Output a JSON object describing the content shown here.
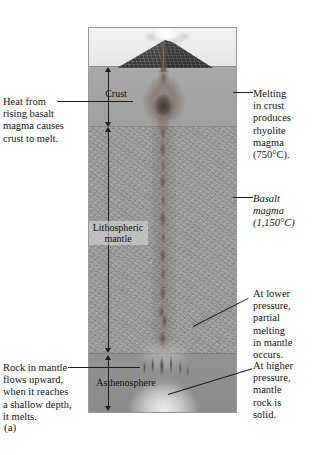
{
  "figure": {
    "caption": "(a)"
  },
  "panel": {
    "layers": [
      {
        "id": "sky",
        "label": "",
        "icon": "sky-region"
      },
      {
        "id": "crust",
        "label": "Crust",
        "icon": "crust-layer"
      },
      {
        "id": "lithospheric",
        "label": "Lithospheric\nmantle",
        "label_line1": "Lithospheric",
        "label_line2": "mantle",
        "icon": "lithospheric-mantle-layer"
      },
      {
        "id": "asthenosphere",
        "label": "Asthenosphere",
        "icon": "asthenosphere-layer"
      }
    ],
    "features": [
      {
        "id": "volcano",
        "name": "volcano-cone-icon"
      },
      {
        "id": "ash-plume",
        "name": "ash-plume-icon"
      },
      {
        "id": "magma-chamber",
        "name": "rhyolite-magma-chamber-icon"
      },
      {
        "id": "basalt-dike",
        "name": "basalt-dike-icon"
      },
      {
        "id": "melt-head",
        "name": "partial-melt-zone-icon"
      },
      {
        "id": "diapirs",
        "name": "mantle-diapir-icon"
      }
    ],
    "depth_scales": [
      {
        "id": "crust-thickness",
        "name": "crust-depth-arrow"
      },
      {
        "id": "lithosphere-thickness",
        "name": "lithospheric-mantle-depth-arrow"
      },
      {
        "id": "asthenosphere-thickness",
        "name": "asthenosphere-depth-arrow"
      }
    ]
  },
  "callouts": {
    "heat": {
      "lines": [
        "Heat from",
        "rising basalt",
        "magma causes",
        "crust to melt."
      ],
      "text": "Heat from rising basalt magma causes crust to melt.",
      "side": "left"
    },
    "rock_in_mantle": {
      "lines": [
        "Rock in mantle",
        "flows upward,",
        "when it reaches",
        "a shallow depth,",
        "it melts."
      ],
      "text": "Rock in mantle flows upward, when it reaches a shallow depth, it melts.",
      "side": "left"
    },
    "melting_in_crust": {
      "lines": [
        "Melting",
        "in crust",
        "produces",
        "rhyolite",
        "magma",
        "(750°C)."
      ],
      "text": "Melting in crust produces rhyolite magma (750°C).",
      "temperature": "750°C",
      "magma_type": "rhyolite",
      "side": "right"
    },
    "basalt_magma": {
      "lines": [
        "Basalt",
        "magma",
        "(1,150°C)"
      ],
      "text": "Basalt magma (1,150°C)",
      "temperature": "1,150°C",
      "magma_type": "basalt",
      "italic": true,
      "side": "right"
    },
    "lower_pressure": {
      "lines": [
        "At lower",
        "pressure,",
        "partial",
        "melting",
        "in mantle",
        "occurs."
      ],
      "text": "At lower pressure, partial melting in mantle occurs.",
      "side": "right"
    },
    "higher_pressure": {
      "lines": [
        "At higher",
        "pressure,",
        "mantle",
        "rock is",
        "solid."
      ],
      "text": "At higher pressure, mantle rock is solid.",
      "side": "right"
    }
  },
  "colors": {
    "sky": "#ececec",
    "crust": "#a4a4a4",
    "lithospheric_mantle": "#9b9b9b",
    "asthenosphere": "#8f8f8f",
    "volcano": "#3d3d3d",
    "magma": "#6e5f5a",
    "leader_line": "#1c1c1c",
    "text": "#141414",
    "panel_border": "#9a9a9a"
  }
}
